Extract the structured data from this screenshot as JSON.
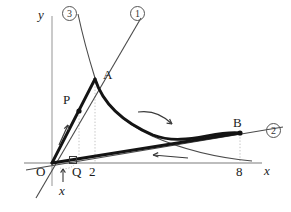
{
  "figure": {
    "background": "#ffffff",
    "ink": "#1a1a1a",
    "axis_color": "#b9b9b9",
    "thin_color": "#555555",
    "guide_color": "#c8c8c8",
    "width": 291,
    "height": 212
  },
  "axes": {
    "x_label": "x",
    "y_label": "y",
    "origin_label": "O",
    "x_axis_y": 163,
    "y_axis_x": 52
  },
  "ticks": [
    {
      "label": "2",
      "x_px": 93,
      "y_px": 172,
      "value": 2
    },
    {
      "label": "8",
      "x_px": 240,
      "y_px": 172,
      "value": 8
    }
  ],
  "points": [
    {
      "name": "A",
      "label": "A",
      "x_px": 95,
      "y_px": 78,
      "label_x": 104,
      "label_y": 70,
      "dot": false
    },
    {
      "name": "B",
      "label": "B",
      "x_px": 240,
      "y_px": 133,
      "label_x": 234,
      "label_y": 118,
      "dot": true
    },
    {
      "name": "P",
      "label": "P",
      "x_px": 79,
      "y_px": 110,
      "label_x": 64,
      "label_y": 95,
      "dot": true
    },
    {
      "name": "Q",
      "label": "Q",
      "x_px": 73,
      "y_px": 163,
      "label_x": 73,
      "label_y": 172,
      "dot": false
    },
    {
      "name": "O",
      "label": "O",
      "x_px": 52,
      "y_px": 163,
      "label_x": 38,
      "label_y": 172,
      "dot": false
    }
  ],
  "curve_labels": [
    {
      "id": "1",
      "label": "①",
      "text": "1",
      "x_px": 130,
      "y_px": 8,
      "describes": "line-OA-extended"
    },
    {
      "id": "2",
      "label": "②",
      "text": "2",
      "x_px": 266,
      "y_px": 124,
      "describes": "line-OB-extended"
    },
    {
      "id": "3",
      "label": "③",
      "text": "3",
      "x_px": 62,
      "y_px": 8,
      "describes": "hyperbola-curve"
    }
  ],
  "annotations": [
    {
      "name": "motion-arrow-P",
      "direction": "up-right",
      "note": "motion of P along OA"
    },
    {
      "name": "motion-arrow-AB",
      "direction": "right",
      "note": "motion along curve A to B"
    },
    {
      "name": "motion-arrow-BO",
      "direction": "left",
      "note": "motion along line B to O"
    },
    {
      "name": "right-angle-Q",
      "note": "right angle mark at Q"
    },
    {
      "name": "variable-x-arrow",
      "label": "x",
      "x_px": 62,
      "y_px": 188,
      "note": "distance x from O to Q"
    }
  ],
  "guides": [
    {
      "name": "dotted-A-to-axis",
      "from_x": 95,
      "from_y": 78,
      "to_x": 95,
      "to_y": 163
    },
    {
      "name": "dotted-P-to-axis",
      "from_x": 79,
      "from_y": 110,
      "to_x": 79,
      "to_y": 163
    },
    {
      "name": "dotted-B-to-axis",
      "from_x": 240,
      "from_y": 133,
      "to_x": 240,
      "to_y": 163
    }
  ]
}
